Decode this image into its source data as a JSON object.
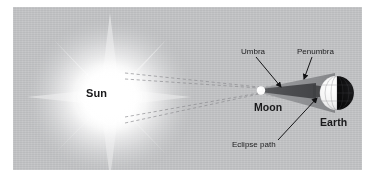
{
  "figure": {
    "panel_color": "#c3c4c6",
    "canvas": {
      "width": 377,
      "height": 185
    }
  },
  "bodies": {
    "sun": {
      "label": "Sun",
      "color": "#ffffff",
      "glow_color": "#f2f2f2",
      "center": [
        97,
        90
      ],
      "radius": 62
    },
    "moon": {
      "label": "Moon",
      "color": "#f4f4f4",
      "center": [
        248,
        83
      ],
      "radius": 4
    },
    "earth": {
      "label": "Earth",
      "lit_color": "#f6f6f6",
      "night_color": "#0b0b0b",
      "center": [
        324,
        86
      ],
      "radius": 17
    }
  },
  "shadow": {
    "umbra": {
      "label": "Umbra",
      "color": "#4c4d50"
    },
    "penumbra": {
      "label": "Penumbra",
      "color": "#8c8d90"
    },
    "eclipse_path": {
      "label": "Eclipse path"
    }
  },
  "rays": {
    "count": 4,
    "style": "dashed",
    "color": "#8e8f92",
    "description": "Sunlight rays converging from Sun past the Moon toward Earth"
  },
  "labels": {
    "sun": "Sun",
    "moon": "Moon",
    "earth": "Earth",
    "umbra": "Umbra",
    "penumbra": "Penumbra",
    "eclipse_path": "Eclipse path"
  }
}
